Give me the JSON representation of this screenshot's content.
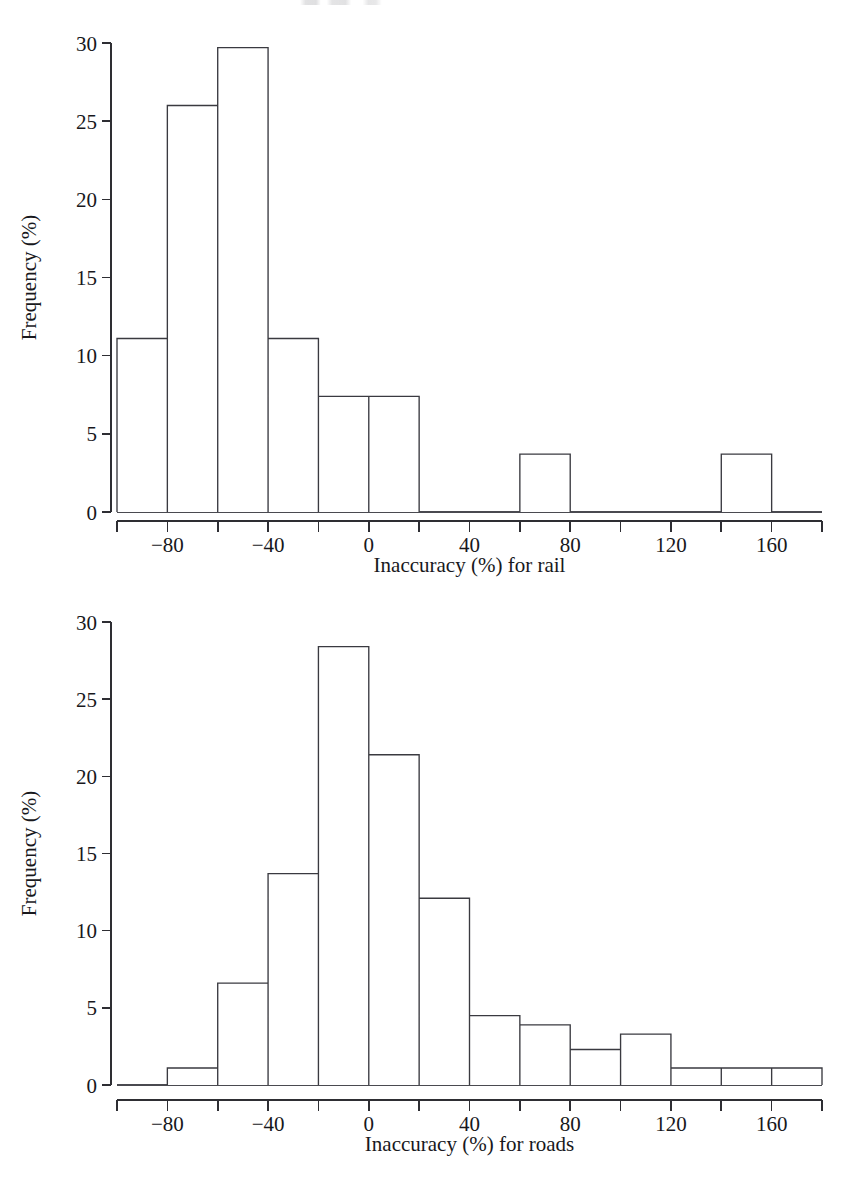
{
  "figure": {
    "background_color": "#ffffff",
    "ink_color": "#2e2e33",
    "bar_fill_color": "#ffffff",
    "bar_stroke_color": "#3a3a40"
  },
  "charts": [
    {
      "id": "rail-histogram",
      "xlabel": "Inaccuracy (%) for rail",
      "ylabel": "Frequency (%)",
      "y_ticks": [
        "0",
        "5",
        "10",
        "15",
        "20",
        "25",
        "30"
      ],
      "x_ticks": [
        "-80",
        "-40",
        "0",
        "40",
        "80",
        "120",
        "160"
      ],
      "x_tick_labels_display": [
        "−80",
        "−40",
        "0",
        "40",
        "80",
        "120",
        "160"
      ]
    },
    {
      "id": "roads-histogram",
      "xlabel": "Inaccuracy (%) for roads",
      "ylabel": "Frequency (%)",
      "y_ticks": [
        "0",
        "5",
        "10",
        "15",
        "20",
        "25",
        "30"
      ],
      "x_ticks": [
        "-80",
        "-40",
        "0",
        "40",
        "80",
        "120",
        "160"
      ],
      "x_tick_labels_display": [
        "−80",
        "−40",
        "0",
        "40",
        "80",
        "120",
        "160"
      ]
    }
  ],
  "chart_data": [
    {
      "type": "bar",
      "id": "rail-histogram",
      "title": "",
      "xlabel": "Inaccuracy (%) for rail",
      "ylabel": "Frequency (%)",
      "xlim": [
        -100,
        180
      ],
      "ylim": [
        0,
        30
      ],
      "bin_width": 20,
      "grid": false,
      "legend": null,
      "bin_edges": [
        -100,
        -80,
        -60,
        -40,
        -20,
        0,
        20,
        40,
        60,
        80,
        100,
        120,
        140,
        160,
        180
      ],
      "categories": [
        "-100 to -80",
        "-80 to -60",
        "-60 to -40",
        "-40 to -20",
        "-20 to 0",
        "0 to 20",
        "20 to 40",
        "40 to 60",
        "60 to 80",
        "80 to 100",
        "100 to 120",
        "120 to 140",
        "140 to 160",
        "160 to 180"
      ],
      "values": [
        11.1,
        26.0,
        29.7,
        11.1,
        7.4,
        7.4,
        0,
        0,
        3.7,
        0,
        0,
        0,
        3.7,
        0
      ],
      "y_tick_values": [
        0,
        5,
        10,
        15,
        20,
        25,
        30
      ],
      "x_tick_values": [
        -100,
        -80,
        -60,
        -40,
        -20,
        0,
        20,
        40,
        60,
        80,
        100,
        120,
        140,
        160,
        180
      ],
      "x_labeled_ticks": [
        -80,
        -40,
        0,
        40,
        80,
        120,
        160
      ]
    },
    {
      "type": "bar",
      "id": "roads-histogram",
      "title": "",
      "xlabel": "Inaccuracy (%) for roads",
      "ylabel": "Frequency (%)",
      "xlim": [
        -100,
        180
      ],
      "ylim": [
        0,
        30
      ],
      "bin_width": 20,
      "grid": false,
      "legend": null,
      "bin_edges": [
        -100,
        -80,
        -60,
        -40,
        -20,
        0,
        20,
        40,
        60,
        80,
        100,
        120,
        140,
        160,
        180
      ],
      "categories": [
        "-100 to -80",
        "-80 to -60",
        "-60 to -40",
        "-40 to -20",
        "-20 to 0",
        "0 to 20",
        "20 to 40",
        "40 to 60",
        "60 to 80",
        "80 to 100",
        "100 to 120",
        "120 to 140",
        "140 to 160",
        "160 to 180"
      ],
      "values": [
        0,
        1.1,
        6.6,
        13.7,
        28.4,
        21.4,
        12.1,
        4.5,
        3.9,
        2.3,
        3.3,
        1.1,
        1.1,
        1.1
      ],
      "y_tick_values": [
        0,
        5,
        10,
        15,
        20,
        25,
        30
      ],
      "x_tick_values": [
        -100,
        -80,
        -60,
        -40,
        -20,
        0,
        20,
        40,
        60,
        80,
        100,
        120,
        140,
        160,
        180
      ],
      "x_labeled_ticks": [
        -80,
        -40,
        0,
        40,
        80,
        120,
        160
      ]
    }
  ]
}
